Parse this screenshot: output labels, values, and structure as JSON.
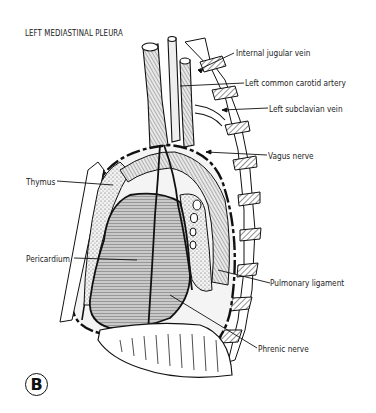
{
  "figure": {
    "title": "LEFT MEDIASTINAL PLEURA",
    "panel_letter": "B",
    "labels": {
      "internal_jugular_vein": "Internal jugular vein",
      "left_common_carotid_artery": "Left common carotid artery",
      "left_subclavian_vein": "Left subclavian vein",
      "vagus_nerve": "Vagus nerve",
      "thymus": "Thymus",
      "pericardium": "Pericardium",
      "pulmonary_ligament": "Pulmonary ligament",
      "phrenic_nerve": "Phrenic nerve"
    },
    "colors": {
      "ink": "#111111",
      "background": "#ffffff",
      "shading": "#9a9a9a"
    }
  }
}
